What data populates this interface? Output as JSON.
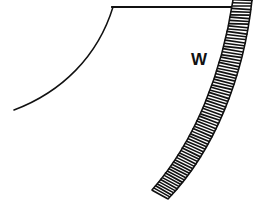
{
  "figure": {
    "kind": "engraving-line-drawing",
    "background_color": "#ffffff",
    "ink_color": "#111111",
    "width": 256,
    "height": 203,
    "labels": [
      {
        "id": "w",
        "text": "W",
        "x": 191,
        "y": 51,
        "font_size": 17,
        "weight": "bold",
        "color": "#111111"
      }
    ],
    "strokes": {
      "top_edge_line": {
        "name": "top-horizontal-edge",
        "from_x": 112,
        "from_y": 7,
        "to_x": 241,
        "to_y": 7,
        "stroke_width": 1.8,
        "color": "#111111"
      },
      "inner_curve": {
        "name": "inner-concave-curve",
        "start_x": 113,
        "start_y": 7,
        "c1_x": 98,
        "c1_y": 56,
        "c2_x": 62,
        "c2_y": 92,
        "end_x": 14,
        "end_y": 110,
        "stroke_width": 1.5,
        "color": "#111111"
      }
    },
    "hatched_band": {
      "name": "curved-hatched-band",
      "description": "Arched masonry band with dense perpendicular hatch strokes between two arc outlines",
      "inner_arc": {
        "start_x": 233,
        "start_y": 0,
        "c1_x": 222,
        "c1_y": 72,
        "c2_x": 196,
        "c2_y": 140,
        "end_x": 152,
        "end_y": 190
      },
      "outer_arc": {
        "start_x": 252,
        "start_y": 0,
        "c1_x": 244,
        "c1_y": 76,
        "c2_x": 215,
        "c2_y": 150,
        "end_x": 168,
        "end_y": 199
      },
      "band_width_px": 19,
      "hatch_count": 74,
      "hatch_stroke_width": 1.5,
      "outline_stroke_width": 1.6,
      "color": "#111111"
    }
  }
}
